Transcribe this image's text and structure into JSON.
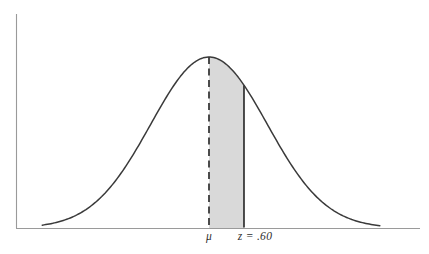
{
  "figure": {
    "background_color": "#ffffff",
    "curve_color": "#3a3a3a",
    "axis_color": "#9a9a9a",
    "shade_color": "#d9d9d9"
  },
  "labels": {
    "mu": "μ",
    "z": "z = .60"
  },
  "chart_data": {
    "type": "area",
    "title": "",
    "subtitle": "",
    "xlabel": "",
    "ylabel": "",
    "grid": false,
    "legend": false,
    "distribution": "normal",
    "mean": 0,
    "std_dev": 1,
    "x_tick_labels": [
      "μ",
      "z = .60"
    ],
    "x_tick_values": [
      0,
      0.6
    ],
    "annotations": [
      {
        "name": "mean-line",
        "label": "μ",
        "x": 0,
        "style": "dashed",
        "from_baseline_to": "curve_peak"
      },
      {
        "name": "z-line",
        "label": "z = .60",
        "x": 0.6,
        "style": "solid",
        "from_baseline_to": "curve"
      }
    ],
    "shaded_area": {
      "x_start": 0,
      "x_end": 0.6,
      "fill": "#d9d9d9",
      "描述": ""
    },
    "x_range": [
      -3.6,
      3.0
    ],
    "y_range": [
      0,
      1
    ],
    "series": [
      {
        "name": "standard-normal-density",
        "x": [
          -3.6,
          -3.2,
          -2.8,
          -2.4,
          -2.0,
          -1.6,
          -1.2,
          -0.8,
          -0.4,
          0.0,
          0.4,
          0.8,
          1.2,
          1.6,
          2.0,
          2.4,
          2.8,
          3.0
        ],
        "values": [
          0.0015,
          0.006,
          0.0198,
          0.0561,
          0.1353,
          0.278,
          0.4868,
          0.7261,
          0.9231,
          1.0,
          0.9231,
          0.7261,
          0.4868,
          0.278,
          0.1353,
          0.0561,
          0.0198,
          0.0111
        ]
      }
    ]
  }
}
